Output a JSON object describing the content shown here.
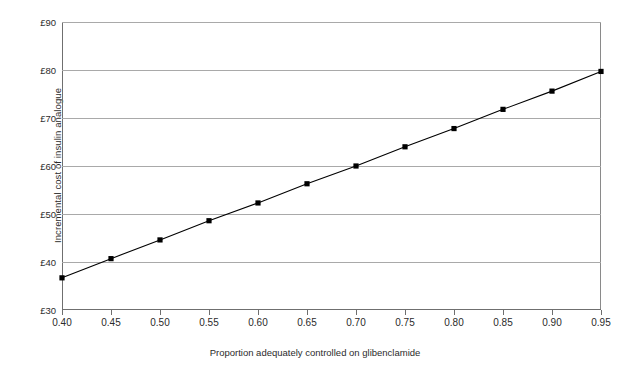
{
  "chart_data": {
    "type": "line",
    "title": "",
    "xlabel": "Proportion adequately controlled on glibenclamide",
    "ylabel": "Incremental cost of insulin analogue",
    "x": [
      0.4,
      0.45,
      0.5,
      0.55,
      0.6,
      0.65,
      0.7,
      0.75,
      0.8,
      0.85,
      0.9,
      0.95
    ],
    "values": [
      36.7,
      40.7,
      44.6,
      48.6,
      52.3,
      56.3,
      60.0,
      64.0,
      67.8,
      71.8,
      75.6,
      79.7
    ],
    "xlim": [
      0.4,
      0.95
    ],
    "ylim": [
      30,
      90
    ],
    "xtick_labels": [
      "0.40",
      "0.45",
      "0.50",
      "0.55",
      "0.60",
      "0.65",
      "0.70",
      "0.75",
      "0.80",
      "0.85",
      "0.90",
      "0.95"
    ],
    "ytick_labels": [
      "£30",
      "£40",
      "£50",
      "£60",
      "£70",
      "£80",
      "£90"
    ],
    "ytick_values": [
      30,
      40,
      50,
      60,
      70,
      80,
      90
    ],
    "grid": "horizontal",
    "legend": "none",
    "marker": "square",
    "marker_color": "#000000",
    "line_color": "#000000",
    "gridline_color": "#a9a9a9",
    "axis_color": "#6f6f6f"
  },
  "caption": {
    "text": ""
  }
}
